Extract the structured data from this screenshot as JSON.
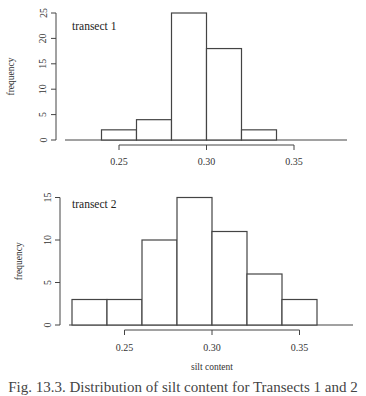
{
  "caption": "Fig. 13.3. Distribution of silt content for Transects 1 and 2",
  "chart_data": [
    {
      "type": "bar",
      "title": "transect 1",
      "xlabel": "",
      "ylabel": "frequency",
      "bin_edges": [
        0.24,
        0.26,
        0.28,
        0.3,
        0.32,
        0.34
      ],
      "categories": [
        "0.24-0.26",
        "0.26-0.28",
        "0.28-0.30",
        "0.30-0.32",
        "0.32-0.34"
      ],
      "values": [
        2,
        4,
        25,
        18,
        2
      ],
      "xlim": [
        0.22,
        0.38
      ],
      "ylim": [
        0,
        25
      ],
      "xticks": [
        "0.25",
        "0.30",
        "0.35"
      ],
      "yticks": [
        "0",
        "5",
        "10",
        "15",
        "20",
        "25"
      ],
      "grid": false
    },
    {
      "type": "bar",
      "title": "transect 2",
      "xlabel": "silt content",
      "ylabel": "frequency",
      "bin_edges": [
        0.22,
        0.24,
        0.26,
        0.28,
        0.3,
        0.32,
        0.34,
        0.36
      ],
      "categories": [
        "0.22-0.24",
        "0.24-0.26",
        "0.26-0.28",
        "0.28-0.30",
        "0.30-0.32",
        "0.32-0.34",
        "0.34-0.36"
      ],
      "values": [
        3,
        3,
        10,
        15,
        11,
        6,
        3
      ],
      "xlim": [
        0.22,
        0.38
      ],
      "ylim": [
        0,
        15
      ],
      "xticks": [
        "0.25",
        "0.30",
        "0.35"
      ],
      "yticks": [
        "0",
        "5",
        "10",
        "15"
      ],
      "grid": false
    }
  ]
}
